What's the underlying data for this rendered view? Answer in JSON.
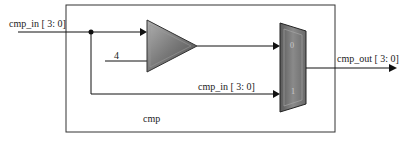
{
  "diagram": {
    "module_name": "cmp",
    "input_label": "cmp_in [ 3: 0]",
    "constant_label": "4",
    "bypass_label": "cmp_in [ 3: 0]",
    "output_label": "cmp_out [ 3: 0]",
    "mux_input_0": "0",
    "mux_input_1": "1",
    "colors": {
      "line": "#111111",
      "block_fill": "#7a7a7a",
      "block_dark": "#3a3a3a",
      "block_light": "#b8b8b8"
    }
  }
}
